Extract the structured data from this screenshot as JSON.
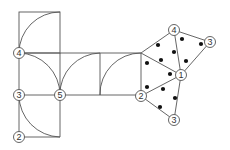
{
  "diagram": {
    "stroke_color": "#555555",
    "dot_color": "#111111",
    "node_labels": {
      "left_4": "4",
      "left_3": "3",
      "left_2": "2",
      "mid_5": "5",
      "tri_4": "4",
      "tri_3_top": "3",
      "tri_1": "1",
      "tri_2": "2",
      "tri_3_bottom": "3"
    }
  }
}
